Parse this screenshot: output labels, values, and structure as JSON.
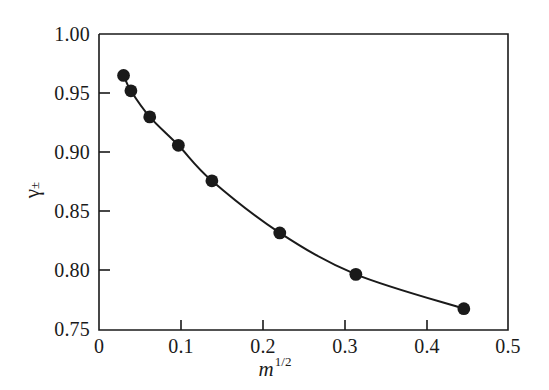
{
  "figure": {
    "background_color": "#ffffff",
    "foreground_color": "#1a1a1a"
  },
  "axes": {
    "y_label_main": "γ",
    "y_label_sub": "±",
    "x_label_main": "m",
    "x_label_sup": "1/2",
    "x_ticks": [
      "0",
      "0.1",
      "0.2",
      "0.3",
      "0.4",
      "0.5"
    ],
    "y_ticks": [
      "1.00",
      "0.95",
      "0.90",
      "0.85",
      "0.80",
      "0.75"
    ]
  },
  "chart_data": {
    "type": "line",
    "title": "",
    "xlabel": "m^1/2",
    "ylabel": "γ±",
    "xlim": [
      0,
      0.5
    ],
    "ylim": [
      0.75,
      1.0
    ],
    "xticks": [
      0,
      0.1,
      0.2,
      0.3,
      0.4,
      0.5
    ],
    "yticks": [
      0.75,
      0.8,
      0.85,
      0.9,
      0.95,
      1.0
    ],
    "grid": false,
    "legend": null,
    "marker": "filled-circle",
    "marker_color": "#1a1a1a",
    "line_color": "#1a1a1a",
    "series": [
      {
        "name": "gamma_pm",
        "x": [
          0.03,
          0.039,
          0.062,
          0.097,
          0.138,
          0.221,
          0.314,
          0.446
        ],
        "y": [
          0.965,
          0.952,
          0.93,
          0.906,
          0.876,
          0.832,
          0.797,
          0.768
        ]
      }
    ]
  }
}
